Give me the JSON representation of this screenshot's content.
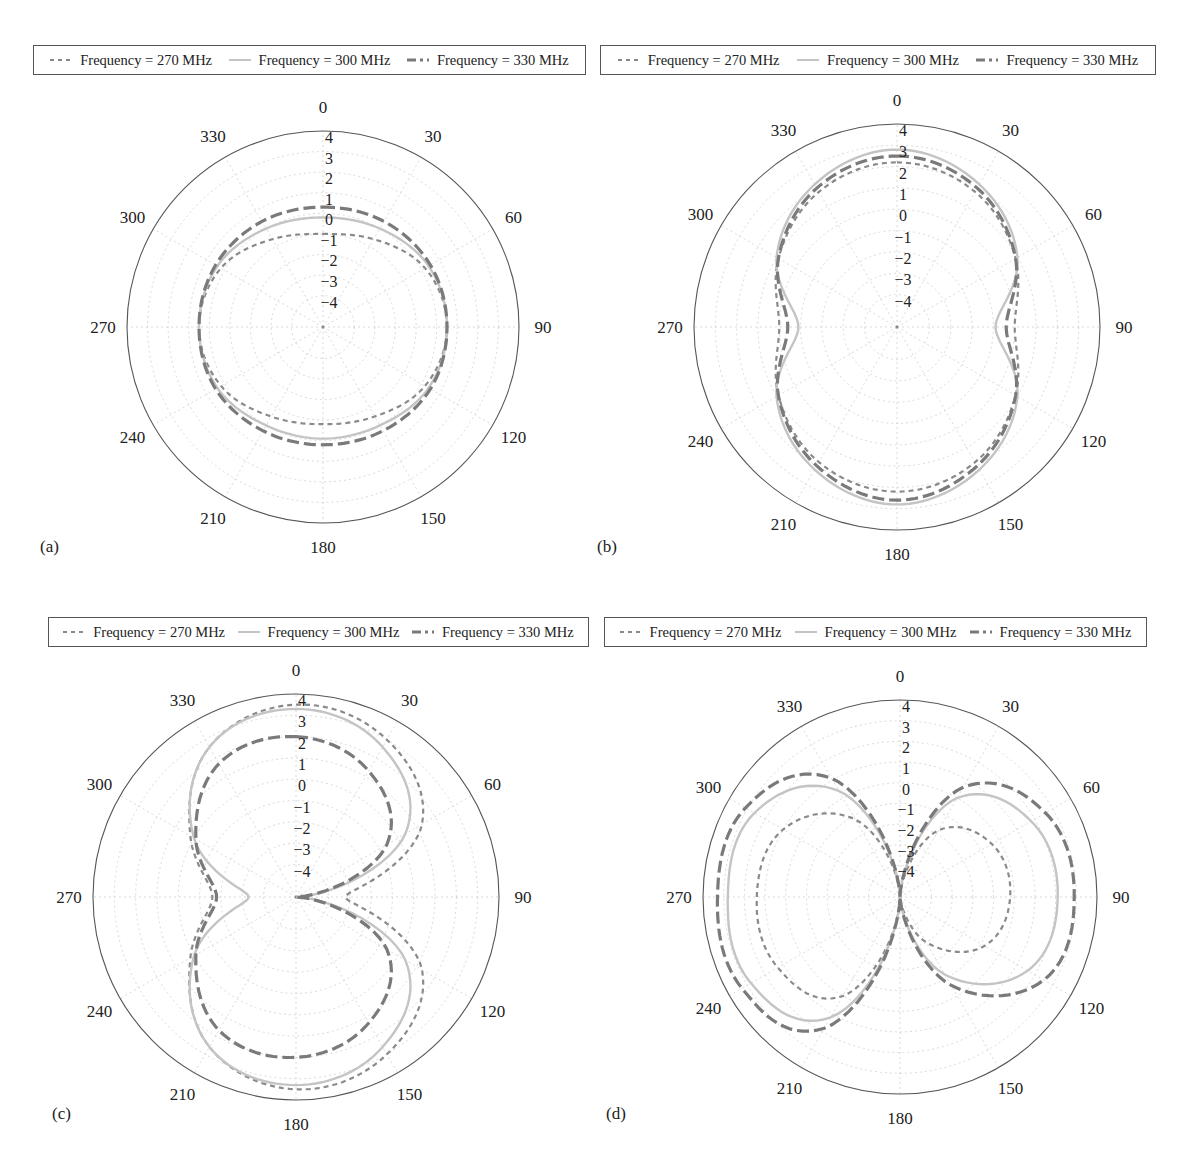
{
  "chart_data": [
    {
      "type": "polar",
      "panel_label": "(a)",
      "title": "",
      "angle_ticks": [
        0,
        30,
        60,
        90,
        120,
        150,
        180,
        210,
        240,
        270,
        300,
        330
      ],
      "radial_ticks": [
        4,
        3,
        2,
        1,
        0,
        -1,
        -2,
        -3,
        -4
      ],
      "radial_range": [
        -5.5,
        4
      ],
      "angle_direction": "clockwise, 0 at top",
      "grid": true,
      "legend": [
        "Frequency = 270 MHz",
        "Frequency = 300 MHz",
        "Frequency = 330 MHz"
      ],
      "legend_position": "top",
      "theta_deg": [
        0,
        30,
        60,
        90,
        120,
        150,
        180,
        210,
        240,
        270,
        300,
        330
      ],
      "series": [
        {
          "name": "Frequency = 270 MHz",
          "style": "short-dash",
          "values": [
            -1.0,
            -0.6,
            0.2,
            0.5,
            0.2,
            -0.5,
            -0.8,
            -0.5,
            0.2,
            0.5,
            0.2,
            -0.6
          ]
        },
        {
          "name": "Frequency = 300 MHz",
          "style": "solid-light",
          "values": [
            -0.2,
            0.0,
            0.4,
            0.5,
            0.4,
            0.0,
            -0.1,
            0.0,
            0.4,
            0.5,
            0.4,
            0.0
          ]
        },
        {
          "name": "Frequency = 330 MHz",
          "style": "long-dash",
          "values": [
            0.3,
            0.4,
            0.5,
            0.5,
            0.5,
            0.3,
            0.2,
            0.3,
            0.5,
            0.5,
            0.5,
            0.4
          ]
        }
      ]
    },
    {
      "type": "polar",
      "panel_label": "(b)",
      "title": "",
      "angle_ticks": [
        0,
        30,
        60,
        90,
        120,
        150,
        180,
        210,
        240,
        270,
        300,
        330
      ],
      "radial_ticks": [
        4,
        3,
        2,
        1,
        0,
        -1,
        -2,
        -3,
        -4
      ],
      "radial_range": [
        -5.5,
        4
      ],
      "angle_direction": "clockwise, 0 at top",
      "grid": true,
      "legend": [
        "Frequency = 270 MHz",
        "Frequency = 300 MHz",
        "Frequency = 330 MHz"
      ],
      "legend_position": "top",
      "theta_deg": [
        0,
        30,
        60,
        90,
        120,
        150,
        180,
        210,
        240,
        270,
        300,
        330
      ],
      "series": [
        {
          "name": "Frequency = 270 MHz",
          "style": "short-dash",
          "values": [
            2.2,
            1.8,
            0.9,
            0.0,
            0.9,
            1.8,
            2.2,
            1.8,
            0.9,
            0.0,
            0.9,
            1.8
          ]
        },
        {
          "name": "Frequency = 300 MHz",
          "style": "solid-light",
          "values": [
            2.8,
            2.2,
            1.0,
            -0.9,
            1.0,
            2.2,
            2.8,
            2.2,
            1.0,
            -0.9,
            1.0,
            2.2
          ]
        },
        {
          "name": "Frequency = 330 MHz",
          "style": "long-dash",
          "values": [
            2.5,
            2.0,
            0.9,
            -0.4,
            0.9,
            2.0,
            2.6,
            2.0,
            0.9,
            -0.4,
            0.9,
            2.0
          ]
        }
      ]
    },
    {
      "type": "polar",
      "panel_label": "(c)",
      "title": "",
      "angle_ticks": [
        0,
        30,
        60,
        90,
        120,
        150,
        180,
        210,
        240,
        270,
        300,
        330
      ],
      "radial_ticks": [
        4,
        3,
        2,
        1,
        0,
        -1,
        -2,
        -3,
        -4
      ],
      "radial_range": [
        -5.5,
        4
      ],
      "angle_direction": "clockwise, 0 at top",
      "grid": true,
      "legend": [
        "Frequency = 270 MHz",
        "Frequency = 300 MHz",
        "Frequency = 330 MHz"
      ],
      "legend_position": "top",
      "theta_deg": [
        0,
        30,
        60,
        90,
        120,
        150,
        180,
        210,
        240,
        270,
        300,
        330
      ],
      "series": [
        {
          "name": "Frequency = 270 MHz",
          "style": "short-dash",
          "values": [
            3.5,
            3.0,
            1.3,
            -3.2,
            1.3,
            3.0,
            3.5,
            2.6,
            0.2,
            -1.6,
            0.2,
            2.6
          ]
        },
        {
          "name": "Frequency = 300 MHz",
          "style": "solid-light",
          "values": [
            3.3,
            2.6,
            0.4,
            -5.5,
            0.4,
            2.6,
            3.3,
            2.6,
            0.0,
            -3.3,
            0.0,
            2.6
          ]
        },
        {
          "name": "Frequency = 330 MHz",
          "style": "long-dash",
          "values": [
            2.0,
            1.3,
            -0.6,
            -5.5,
            -0.6,
            1.3,
            2.0,
            1.7,
            -0.1,
            -1.8,
            -0.1,
            1.7
          ]
        }
      ]
    },
    {
      "type": "polar",
      "panel_label": "(d)",
      "title": "",
      "angle_ticks": [
        0,
        30,
        60,
        90,
        120,
        150,
        180,
        210,
        240,
        270,
        300,
        330
      ],
      "radial_ticks": [
        4,
        3,
        2,
        1,
        0,
        -1,
        -2,
        -3,
        -4
      ],
      "radial_range": [
        -5.5,
        4
      ],
      "angle_direction": "clockwise, 0 at top",
      "grid": true,
      "legend": [
        "Frequency = 270 MHz",
        "Frequency = 300 MHz",
        "Frequency = 330 MHz"
      ],
      "legend_position": "top",
      "theta_deg": [
        0,
        30,
        60,
        90,
        120,
        150,
        180,
        210,
        240,
        270,
        300,
        330
      ],
      "series": [
        {
          "name": "Frequency = 270 MHz",
          "style": "short-dash",
          "values": [
            -5.5,
            -1.8,
            -0.4,
            -0.2,
            -0.8,
            -3.0,
            -5.5,
            0.0,
            1.3,
            1.4,
            1.0,
            -1.2
          ]
        },
        {
          "name": "Frequency = 300 MHz",
          "style": "solid-light",
          "values": [
            -5.5,
            0.0,
            1.8,
            2.1,
            1.6,
            -1.2,
            -5.5,
            1.2,
            2.8,
            2.8,
            2.6,
            0.4
          ]
        },
        {
          "name": "Frequency = 330 MHz",
          "style": "long-dash",
          "values": [
            -5.5,
            0.6,
            2.6,
            2.9,
            2.5,
            -0.6,
            -5.5,
            1.8,
            3.3,
            3.3,
            3.1,
            1.1
          ]
        }
      ]
    }
  ],
  "panels": [
    {
      "label": "(a)",
      "legend": {
        "items": [
          "Frequency = 270 MHz",
          "Frequency = 300 MHz",
          "Frequency = 330 MHz"
        ]
      }
    },
    {
      "label": "(b)",
      "legend": {
        "items": [
          "Frequency = 270 MHz",
          "Frequency = 300 MHz",
          "Frequency = 330 MHz"
        ]
      }
    },
    {
      "label": "(c)",
      "legend": {
        "items": [
          "Frequency = 270 MHz",
          "Frequency = 300 MHz",
          "Frequency = 330 MHz"
        ]
      }
    },
    {
      "label": "(d)",
      "legend": {
        "items": [
          "Frequency = 270 MHz",
          "Frequency = 300 MHz",
          "Frequency = 330 MHz"
        ]
      }
    }
  ],
  "colors": {
    "series_270": "#8a8a8a",
    "series_300": "#c4c4c4",
    "series_330": "#7a7a7a",
    "grid": "#cfcfcf",
    "axis": "#555555",
    "text": "#222222"
  }
}
